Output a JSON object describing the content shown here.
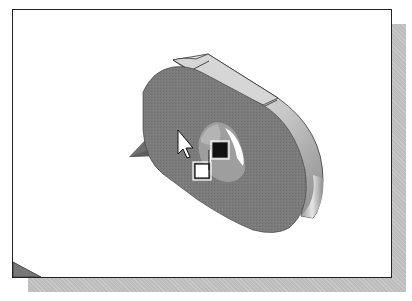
{
  "window": {
    "type": "cad-graphics-viewport",
    "background_color": "#ffffff",
    "border_color": "#222222",
    "shadow_color": "#bdbdbd"
  },
  "model": {
    "shape": "obround-plate-with-hole",
    "front_face_color": "#7a7a7a",
    "top_band_color": "#d6d6d6",
    "side_face_color_light": "#e2e2e2",
    "side_face_color_dark": "#8c8c8c",
    "hole_inner_color": "#a8a8a8",
    "edge_color": "#333333"
  },
  "cursor": {
    "type": "select-arrow",
    "selection_filter_icon": "face-select",
    "icon_fill_primary": "#111111",
    "icon_fill_secondary": "#ffffff"
  },
  "triad": {
    "visible_fragment": "plane-arrow",
    "color": "#6e6e6e"
  },
  "corner_indicator": {
    "position": "bottom-left",
    "color": "#777777"
  }
}
